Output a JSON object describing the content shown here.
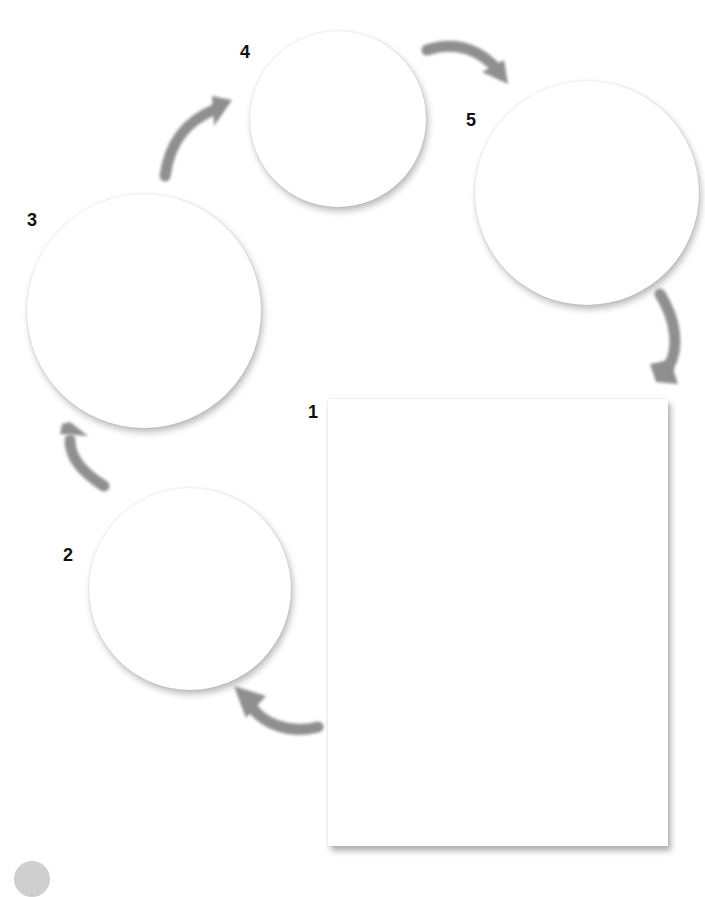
{
  "diagram": {
    "type": "cycle",
    "arrow_color": "#8f8f8f",
    "nodes": [
      {
        "id": 1,
        "label": "1",
        "shape": "rectangle",
        "x": 328,
        "y": 399,
        "w": 340,
        "h": 447
      },
      {
        "id": 2,
        "label": "2",
        "shape": "circle",
        "cx": 190,
        "cy": 589,
        "r": 101
      },
      {
        "id": 3,
        "label": "3",
        "shape": "circle",
        "cx": 144,
        "cy": 311,
        "r": 117
      },
      {
        "id": 4,
        "label": "4",
        "shape": "circle",
        "cx": 338,
        "cy": 119,
        "r": 88
      },
      {
        "id": 5,
        "label": "5",
        "shape": "circle",
        "cx": 587,
        "cy": 193,
        "r": 112
      }
    ],
    "edges": [
      {
        "from": 1,
        "to": 2
      },
      {
        "from": 2,
        "to": 3
      },
      {
        "from": 3,
        "to": 4
      },
      {
        "from": 4,
        "to": 5
      },
      {
        "from": 5,
        "to": 1
      }
    ]
  }
}
